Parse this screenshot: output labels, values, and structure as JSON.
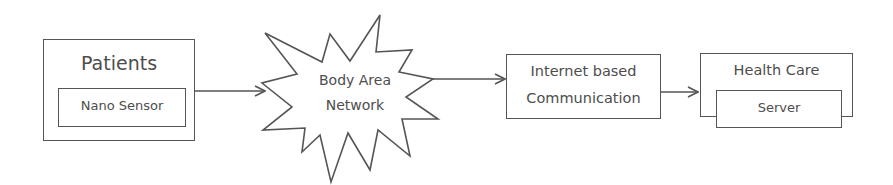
{
  "diagram": {
    "nodes": [
      {
        "id": "patients",
        "label": "Patients",
        "inner_label": "Nano Sensor"
      },
      {
        "id": "ban",
        "label_line1": "Body Area",
        "label_line2": "Network",
        "shape": "starburst"
      },
      {
        "id": "internet",
        "label_line1": "Internet based",
        "label_line2": "Communication"
      },
      {
        "id": "healthcare",
        "label": "Health Care",
        "inner_label": "Server"
      }
    ],
    "edges": [
      {
        "from": "patients",
        "to": "ban"
      },
      {
        "from": "ban",
        "to": "internet"
      },
      {
        "from": "internet",
        "to": "healthcare"
      }
    ],
    "colors": {
      "stroke": "#555555",
      "text": "#4d4d4d",
      "background": "#ffffff"
    }
  }
}
